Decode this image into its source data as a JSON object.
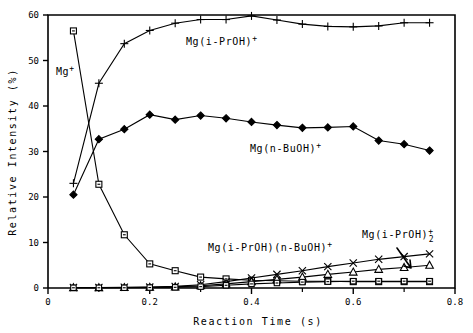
{
  "chart_data": {
    "type": "line",
    "title": "",
    "xlabel": "Reaction Time (s)",
    "ylabel": "Relative Intensity (%)",
    "xlim": [
      0,
      0.8
    ],
    "ylim": [
      0,
      60
    ],
    "xticks": [
      0,
      0.2,
      0.4,
      0.6,
      0.8
    ],
    "xticklabels": [
      "0",
      "0.2",
      "0.4",
      "0.6",
      "0.8"
    ],
    "xminorticks": [
      0.1,
      0.3,
      0.5,
      0.7
    ],
    "yticks": [
      0,
      10,
      20,
      30,
      40,
      50,
      60
    ],
    "yticklabels": [
      "0",
      "10",
      "20",
      "30",
      "40",
      "50",
      "60"
    ],
    "grid": false,
    "legend_position": "inline-annotations",
    "x": [
      0.05,
      0.1,
      0.15,
      0.2,
      0.25,
      0.3,
      0.35,
      0.4,
      0.45,
      0.5,
      0.55,
      0.6,
      0.65,
      0.7,
      0.75
    ],
    "series": [
      {
        "name": "Mg+",
        "label": "Mg",
        "label_sup": "+",
        "marker": "open-square",
        "values": [
          56.5,
          22.8,
          11.7,
          5.3,
          3.8,
          2.4,
          2.0,
          1.7,
          1.6,
          1.5,
          1.5,
          1.4,
          1.4,
          1.4,
          1.4
        ]
      },
      {
        "name": "Mg(i-PrOH)+",
        "label": "Mg(i-PrOH)",
        "label_sup": "+",
        "marker": "plus",
        "values": [
          23.0,
          45.0,
          53.7,
          56.6,
          58.2,
          59.0,
          59.0,
          59.8,
          58.9,
          58.0,
          57.5,
          57.4,
          57.6,
          58.3,
          58.3
        ]
      },
      {
        "name": "Mg(n-BuOH)+",
        "label": "Mg(n-BuOH)",
        "label_sup": "+",
        "marker": "solid-diamond",
        "values": [
          20.5,
          32.7,
          34.9,
          38.1,
          37.0,
          37.9,
          37.3,
          36.5,
          35.8,
          35.2,
          35.3,
          35.5,
          32.4,
          31.6,
          30.2
        ]
      },
      {
        "name": "Mg(i-PrOH)(n-BuOH)+",
        "label": "Mg(i-PrOH)(n-BuOH)",
        "label_sup": "+",
        "marker": "cross",
        "values": [
          0.1,
          0.1,
          0.15,
          0.2,
          0.35,
          0.7,
          1.4,
          2.2,
          3.0,
          3.8,
          4.7,
          5.5,
          6.3,
          6.9,
          7.5
        ]
      },
      {
        "name": "Mg(i-PrOH)2+",
        "label": "Mg(i-PrOH)",
        "label_sup": "+",
        "label_sub": "2",
        "marker": "open-triangle",
        "values": [
          0.05,
          0.05,
          0.1,
          0.15,
          0.25,
          0.5,
          0.9,
          1.4,
          1.9,
          2.4,
          3.0,
          3.5,
          4.1,
          4.5,
          5.0
        ]
      },
      {
        "name": "low-square-series",
        "label": "",
        "marker": "open-square-low",
        "values": [
          0.05,
          0.05,
          0.05,
          0.1,
          0.15,
          0.3,
          0.6,
          0.9,
          1.1,
          1.3,
          1.4,
          1.5,
          1.5,
          1.5,
          1.5
        ]
      }
    ],
    "annotations": [
      {
        "id": "ann-mg",
        "text": "Mg",
        "sup": "+",
        "x_px": 56,
        "y_px": 75
      },
      {
        "id": "ann-iproh",
        "text": "Mg(i-PrOH)",
        "sup": "+",
        "x_px": 186,
        "y_px": 45
      },
      {
        "id": "ann-nbuoh",
        "text": "Mg(n-BuOH)",
        "sup": "+",
        "x_px": 250,
        "y_px": 152
      },
      {
        "id": "ann-mixed",
        "text": "Mg(i-PrOH)(n-BuOH)",
        "sup": "+",
        "x_px": 208,
        "y_px": 251
      },
      {
        "id": "ann-iproh2",
        "text": "Mg(i-PrOH)",
        "sup": "+",
        "sub": "2",
        "x_px": 362,
        "y_px": 238
      }
    ]
  }
}
